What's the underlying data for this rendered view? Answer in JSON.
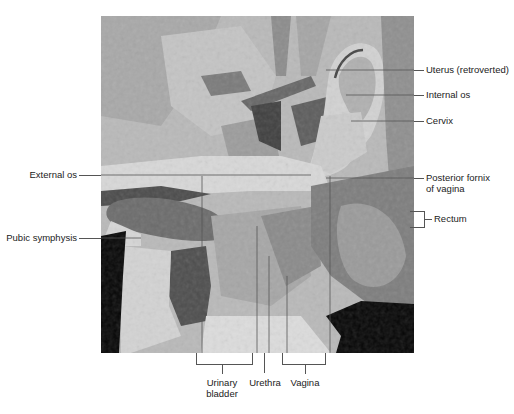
{
  "figure": {
    "labels_right": [
      {
        "text": "Uterus (retroverted)"
      },
      {
        "text": "Internal os"
      },
      {
        "text": "Cervix"
      },
      {
        "text": "Posterior fornix",
        "text2": "of vagina"
      },
      {
        "text": "Rectum"
      }
    ],
    "labels_left": [
      {
        "text": "External os"
      },
      {
        "text": "Pubic symphysis"
      }
    ],
    "labels_bottom": [
      {
        "text": "Urinary",
        "text2": "bladder"
      },
      {
        "text": "Urethra"
      },
      {
        "text": "Vagina"
      }
    ],
    "colors": {
      "background": "#ffffff",
      "leader_line": "#555555",
      "label_text": "#222222",
      "void": "#050505"
    }
  }
}
